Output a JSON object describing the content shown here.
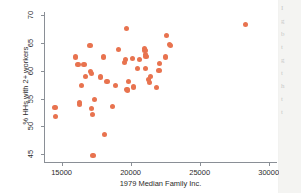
{
  "figure": {
    "marker_color": "#e8734f",
    "axis_color": "#8a8f96",
    "background": "#ffffff"
  },
  "margin_text": {
    "lines": [
      "I",
      "g",
      "b",
      "t",
      "g",
      "t",
      "h",
      "t",
      "t"
    ]
  },
  "chart_data": {
    "type": "scatter",
    "title": "",
    "xlabel": "1979 Median Family Inc.",
    "ylabel": "% HHs with 2+ workers",
    "xlim": [
      13800,
      30600
    ],
    "ylim": [
      43.6,
      70.6
    ],
    "xticks": [
      15000,
      20000,
      25000,
      30000
    ],
    "yticks": [
      45,
      50,
      55,
      60,
      65,
      70
    ],
    "xtick_labels": [
      "15000",
      "20000",
      "25000",
      "30000"
    ],
    "ytick_labels": [
      "45",
      "50",
      "55",
      "60",
      "65",
      "70"
    ],
    "grid": false,
    "legend": false,
    "series": [
      {
        "name": "observations",
        "marker": "circle",
        "color": "#e8734f",
        "points": [
          [
            14530,
            53.4
          ],
          [
            14560,
            51.8
          ],
          [
            15980,
            62.5
          ],
          [
            16190,
            61.2
          ],
          [
            16280,
            54.3
          ],
          [
            16300,
            54.0
          ],
          [
            16430,
            57.3
          ],
          [
            16620,
            61.1
          ],
          [
            16730,
            59.0
          ],
          [
            17060,
            64.5
          ],
          [
            17110,
            59.9
          ],
          [
            17150,
            59.5
          ],
          [
            17190,
            53.2
          ],
          [
            17230,
            52.1
          ],
          [
            17280,
            44.7
          ],
          [
            17410,
            54.8
          ],
          [
            17810,
            58.9
          ],
          [
            18050,
            62.5
          ],
          [
            18120,
            48.5
          ],
          [
            18290,
            58.1
          ],
          [
            18680,
            53.6
          ],
          [
            18930,
            57.4
          ],
          [
            19110,
            63.8
          ],
          [
            19530,
            61.5
          ],
          [
            19620,
            62.1
          ],
          [
            19700,
            67.6
          ],
          [
            19740,
            56.6
          ],
          [
            19780,
            56.4
          ],
          [
            19830,
            58.1
          ],
          [
            20150,
            62.3
          ],
          [
            20210,
            57.1
          ],
          [
            20470,
            60.5
          ],
          [
            20640,
            62.0
          ],
          [
            20980,
            64.0
          ],
          [
            21040,
            63.6
          ],
          [
            21060,
            60.4
          ],
          [
            21090,
            63.0
          ],
          [
            21120,
            62.6
          ],
          [
            21310,
            58.4
          ],
          [
            21360,
            57.9
          ],
          [
            21430,
            59.0
          ],
          [
            21880,
            57.0
          ],
          [
            22050,
            60.0
          ],
          [
            22080,
            61.3
          ],
          [
            22530,
            62.5
          ],
          [
            22620,
            66.4
          ],
          [
            22820,
            64.8
          ],
          [
            22860,
            64.6
          ],
          [
            28320,
            68.3
          ]
        ]
      }
    ]
  }
}
